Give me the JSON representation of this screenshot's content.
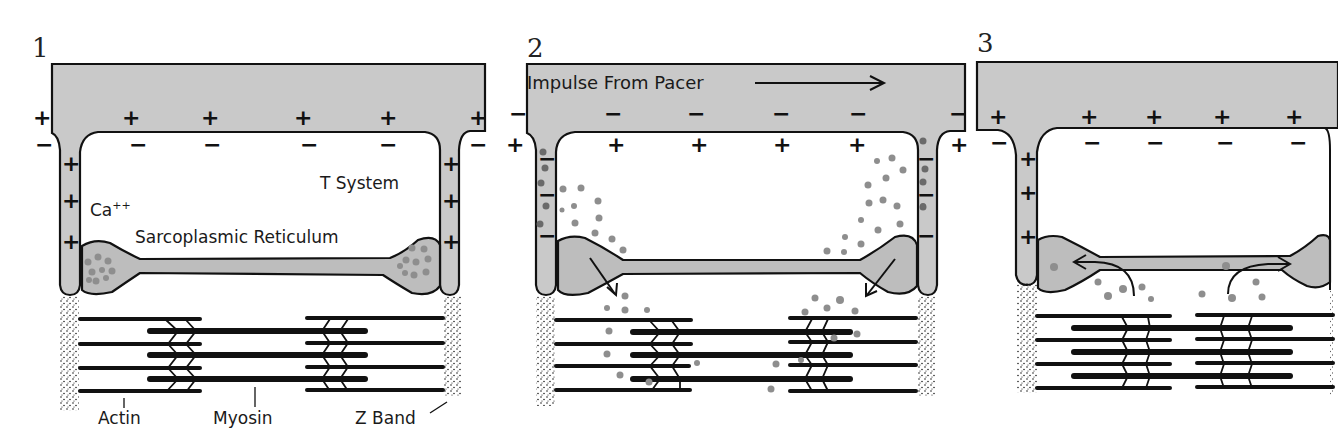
{
  "figure": {
    "panels": [
      {
        "number": "1",
        "state": "resting",
        "outer_charges": [
          "+",
          "+",
          "+",
          "+",
          "+",
          "+"
        ],
        "inner_charges": [
          "−",
          "−",
          "−",
          "−",
          "−",
          "−"
        ],
        "t_tubule_charges": [
          "+",
          "+",
          "+"
        ],
        "labels": {
          "t_system": "T System",
          "calcium": "Ca",
          "calcium_superscript": "++",
          "sarcoplasmic_reticulum": "Sarcoplasmic Reticulum",
          "actin": "Actin",
          "myosin": "Myosin",
          "z_band": "Z Band"
        }
      },
      {
        "number": "2",
        "state": "depolarized / calcium released",
        "impulse_label": "Impulse From Pacer",
        "outer_charges": [
          "−",
          "−",
          "−",
          "−",
          "−",
          "−",
          "−"
        ],
        "inner_charges": [
          "+",
          "+",
          "+",
          "+",
          "+",
          "+"
        ],
        "t_tubule_charges": [
          "−",
          "−",
          "−"
        ]
      },
      {
        "number": "3",
        "state": "repolarized / calcium reuptake",
        "outer_charges": [
          "+",
          "+",
          "+",
          "+",
          "+",
          "+"
        ],
        "inner_charges": [
          "−",
          "−",
          "−",
          "−",
          "−"
        ],
        "t_tubule_charges": [
          "+",
          "+",
          "+"
        ]
      }
    ],
    "colors": {
      "membrane_fill": "#c9c9c9",
      "sr_fill": "#bdbdbd",
      "calcium_dot": "#8e8e8e",
      "line": "#111111"
    }
  }
}
